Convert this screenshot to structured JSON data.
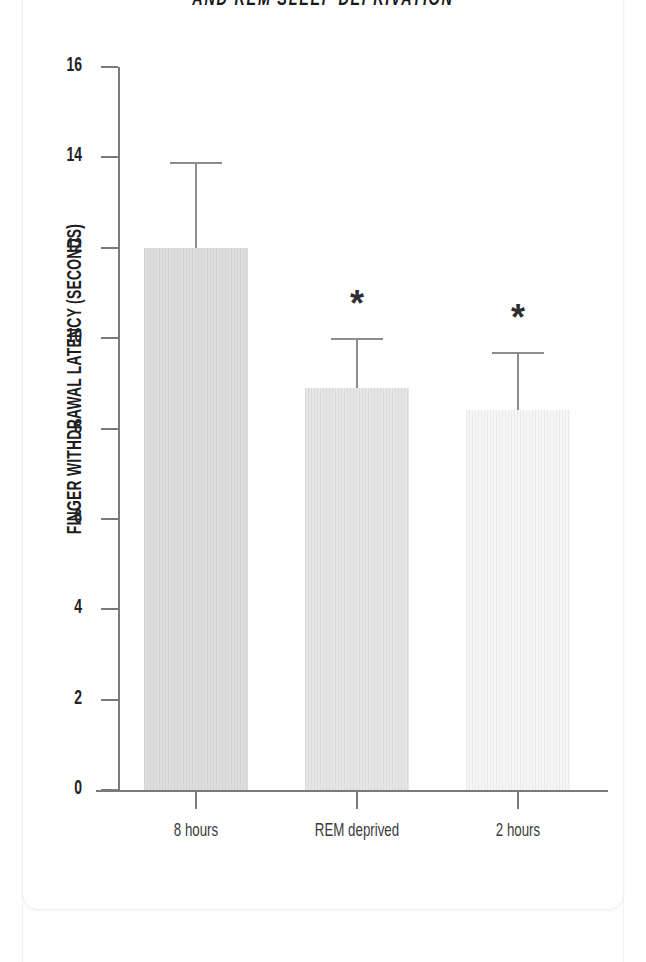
{
  "figure": {
    "title": "AND REM SLEEP DEPRIVATION",
    "significance_marker": "*"
  },
  "chart_data": {
    "type": "bar",
    "title": "AND REM SLEEP DEPRIVATION",
    "xlabel": "",
    "ylabel": "FINGER WITHDRAWAL LATENCY (SECONDS)",
    "categories": [
      "8 hours",
      "REM deprived",
      "2 hours"
    ],
    "values": [
      12.0,
      8.9,
      8.4
    ],
    "errors_upper": [
      13.9,
      10.0,
      9.7
    ],
    "error_magnitudes": [
      1.9,
      1.1,
      1.3
    ],
    "significance": [
      "",
      "*",
      "*"
    ],
    "bar_colors": [
      "#dededf",
      "#e6e6e7",
      "#f6f6f7"
    ],
    "axis_color": "#7a7a7c",
    "errorbar_color": "#8d8d90",
    "ylim": [
      0,
      16
    ],
    "yticks": [
      0,
      2,
      4,
      6,
      8,
      10,
      12,
      14,
      16
    ],
    "ytick_labels": [
      "0",
      "2",
      "4",
      "6",
      "8",
      "10",
      "12",
      "14",
      "16"
    ],
    "grid": false,
    "legend": "none"
  }
}
